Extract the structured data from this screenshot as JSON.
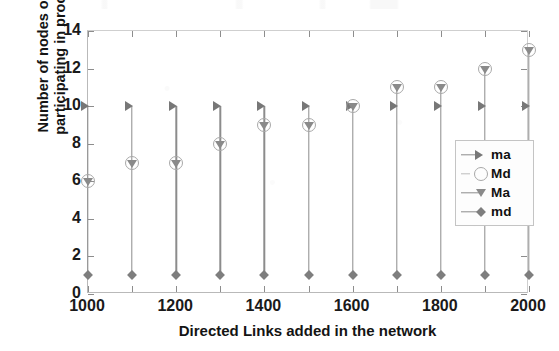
{
  "chart_data": {
    "type": "line",
    "title": "",
    "xlabel": "Directed Links added in the network",
    "ylabel_line1": "Number of nodes or links",
    "ylabel_line2": "participating in processes",
    "x": [
      1000,
      1100,
      1200,
      1300,
      1400,
      1500,
      1600,
      1700,
      1800,
      1900,
      2000
    ],
    "xlim": [
      1000,
      2000
    ],
    "ylim": [
      0,
      14
    ],
    "xtick_labels": [
      "1000",
      "1200",
      "1400",
      "1600",
      "1800",
      "2000"
    ],
    "xticks_major": [
      1000,
      1200,
      1400,
      1600,
      1800,
      2000
    ],
    "xticks_minor": [
      1100,
      1300,
      1500,
      1700,
      1900
    ],
    "ytick_labels": [
      "0",
      "2",
      "4",
      "6",
      "8",
      "10",
      "12",
      "14"
    ],
    "yticks": [
      0,
      2,
      4,
      6,
      8,
      10,
      12,
      14
    ],
    "grid": false,
    "legend_position": "right-middle",
    "series": [
      {
        "name": "ma",
        "marker": "triangle-right",
        "color": "#777777",
        "values": [
          10,
          10,
          10,
          10,
          10,
          10,
          10,
          10,
          10,
          10,
          10
        ]
      },
      {
        "name": "Md",
        "marker": "circle-open",
        "color": "#a8a8a8",
        "values": [
          6,
          7,
          7,
          8,
          9,
          9,
          10,
          11,
          11,
          12,
          13
        ]
      },
      {
        "name": "Ma",
        "marker": "triangle-down",
        "color": "#8a8a8a",
        "values": [
          6,
          7,
          7,
          8,
          9,
          9,
          10,
          11,
          11,
          12,
          13
        ]
      },
      {
        "name": "md",
        "marker": "diamond",
        "color": "#7e7e7e",
        "values": [
          1,
          1,
          1,
          1,
          1,
          1,
          1,
          1,
          1,
          1,
          1
        ]
      }
    ]
  },
  "legend": {
    "entries": [
      {
        "label": "ma",
        "marker": "triangle-right-icon"
      },
      {
        "label": "Md",
        "marker": "circle-open-icon"
      },
      {
        "label": "Ma",
        "marker": "triangle-down-icon"
      },
      {
        "label": "md",
        "marker": "diamond-icon"
      }
    ]
  }
}
